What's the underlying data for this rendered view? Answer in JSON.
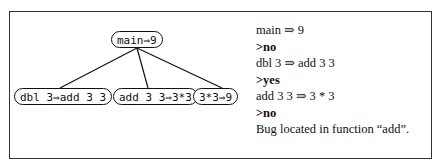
{
  "tree": {
    "root": "main⇒9",
    "children": [
      "dbl 3⇒add 3 3",
      "add 3 3⇒3*3",
      "3*3⇒9"
    ]
  },
  "dialog": [
    {
      "text": "main ⇒ 9",
      "type": "statement"
    },
    {
      "text": ">no",
      "type": "prompt"
    },
    {
      "text": "dbl 3 ⇒ add 3 3",
      "type": "statement"
    },
    {
      "text": ">yes",
      "type": "prompt"
    },
    {
      "text": "add 3 3 ⇒ 3 * 3",
      "type": "statement"
    },
    {
      "text": ">no",
      "type": "prompt"
    },
    {
      "text": "Bug located in function “add”.",
      "type": "statement"
    }
  ]
}
